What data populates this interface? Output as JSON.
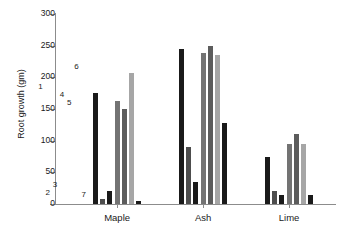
{
  "chart_data": {
    "type": "bar",
    "title": "",
    "subtitle": "",
    "xlabel": "",
    "ylabel": "Root growth (gm)",
    "ylim": [
      0,
      300
    ],
    "yticks": [
      0,
      50,
      100,
      150,
      200,
      250,
      300
    ],
    "grid": false,
    "legend_position": "none",
    "categories": [
      "Maple",
      "Ash",
      "Lime"
    ],
    "bar_labels": [
      "1",
      "2",
      "3",
      "4",
      "5",
      "6",
      "7"
    ],
    "bar_label_group": "Maple",
    "series": [
      {
        "name": "1",
        "color": "#1a1a1a",
        "values": [
          175,
          245,
          75
        ]
      },
      {
        "name": "2",
        "color": "#4d4d4d",
        "values": [
          8,
          90,
          20
        ]
      },
      {
        "name": "3",
        "color": "#1a1a1a",
        "values": [
          20,
          35,
          15
        ]
      },
      {
        "name": "4",
        "color": "#737373",
        "values": [
          163,
          238,
          95
        ]
      },
      {
        "name": "5",
        "color": "#5c5c5c",
        "values": [
          150,
          250,
          110
        ]
      },
      {
        "name": "6",
        "color": "#a6a6a6",
        "values": [
          207,
          235,
          95
        ]
      },
      {
        "name": "7",
        "color": "#1a1a1a",
        "values": [
          4,
          128,
          15
        ]
      }
    ]
  },
  "axis": {
    "y_title": "Root growth (gm)",
    "y_tick_labels": [
      "300",
      "250",
      "200",
      "150",
      "100",
      "50",
      "0"
    ]
  },
  "colors": {
    "axis": "#8c8c8c",
    "text": "#1a1a1a",
    "background": "#ffffff"
  }
}
